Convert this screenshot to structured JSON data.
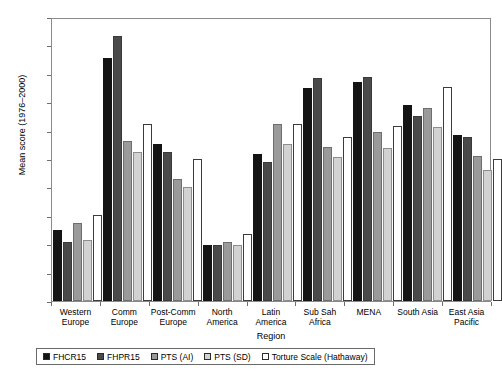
{
  "chart_data": {
    "type": "bar",
    "title": "",
    "xlabel": "Region",
    "ylabel": "Mean score (1976–2000)",
    "ylim": [
      0,
      5
    ],
    "ytick_values": [
      0,
      0.5,
      1,
      1.5,
      2,
      2.5,
      3,
      3.5,
      4,
      4.5,
      5
    ],
    "ytick_labels": [
      "0",
      "0.5",
      "1",
      "1.5",
      "2",
      "2.5",
      "3",
      "3.5",
      "4",
      "4.5",
      "5"
    ],
    "grid": false,
    "legend_position": "below-axis",
    "categories": [
      "Western Europe",
      "Comm Europe",
      "Post-Comm Europe",
      "North America",
      "Latin America",
      "Sub Sah Africa",
      "MENA",
      "South Asia",
      "East Asia Pacific"
    ],
    "category_lines": [
      [
        "Western",
        "Europe"
      ],
      [
        "Comm",
        "Europe"
      ],
      [
        "Post-Comm",
        "Europe"
      ],
      [
        "North",
        "America"
      ],
      [
        "Latin America",
        ""
      ],
      [
        "Sub Sah",
        "Africa"
      ],
      [
        "MENA",
        ""
      ],
      [
        "South Asia",
        ""
      ],
      [
        "East Asia",
        "Pacific"
      ]
    ],
    "series": [
      {
        "name": "FHCR15",
        "color": "#141414",
        "values": [
          1.26,
          4.3,
          2.78,
          1.0,
          2.61,
          3.78,
          3.88,
          3.48,
          2.94
        ]
      },
      {
        "name": "FHPR15",
        "color": "#4a4a4a",
        "values": [
          1.04,
          4.69,
          2.64,
          1.0,
          2.46,
          3.96,
          3.97,
          3.28,
          2.9
        ]
      },
      {
        "name": "PTS (AI)",
        "color": "#9a9a9a",
        "values": [
          1.38,
          2.83,
          2.17,
          1.05,
          3.14,
          2.73,
          2.99,
          3.43,
          2.57
        ]
      },
      {
        "name": "PTS (SD)",
        "color": "#d2d2d2",
        "values": [
          1.09,
          2.64,
          2.03,
          0.99,
          2.78,
          2.56,
          2.71,
          3.09,
          2.33
        ]
      },
      {
        "name": "Torture Scale (Hathaway)",
        "color": "#ffffff",
        "values": [
          1.53,
          3.13,
          2.52,
          1.18,
          3.14,
          2.9,
          3.1,
          3.79,
          2.52
        ]
      }
    ]
  }
}
